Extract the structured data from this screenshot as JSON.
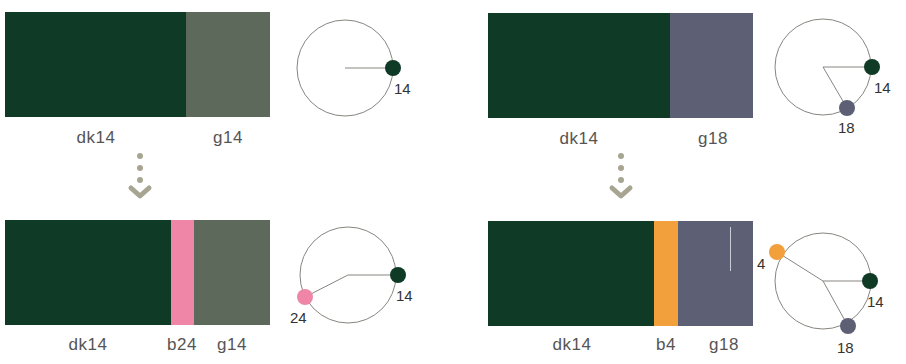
{
  "colors": {
    "dk14": "#0f3a26",
    "g14": "#5d6a5b",
    "g18": "#5d6074",
    "b24": "#ef86a8",
    "b4": "#f2a03c",
    "wheel_line": "#888580",
    "arrow": "#a7a592"
  },
  "panels": [
    {
      "id": "top-left",
      "labels": {
        "a": "dk14",
        "c": "g14"
      },
      "wheel": {
        "points": [
          {
            "label": "14",
            "color": "dk14"
          }
        ]
      }
    },
    {
      "id": "top-right",
      "labels": {
        "a": "dk14",
        "c": "g18"
      },
      "wheel": {
        "points": [
          {
            "label": "14",
            "color": "dk14"
          },
          {
            "label": "18",
            "color": "g18"
          }
        ]
      }
    },
    {
      "id": "bottom-left",
      "labels": {
        "a": "dk14",
        "b": "b24",
        "c": "g14"
      },
      "wheel": {
        "points": [
          {
            "label": "14",
            "color": "dk14"
          },
          {
            "label": "24",
            "color": "b24"
          }
        ]
      }
    },
    {
      "id": "bottom-right",
      "labels": {
        "a": "dk14",
        "b": "b4",
        "c": "g18"
      },
      "wheel": {
        "points": [
          {
            "label": "4",
            "color": "b4"
          },
          {
            "label": "14",
            "color": "dk14"
          },
          {
            "label": "18",
            "color": "g18"
          }
        ]
      }
    }
  ]
}
